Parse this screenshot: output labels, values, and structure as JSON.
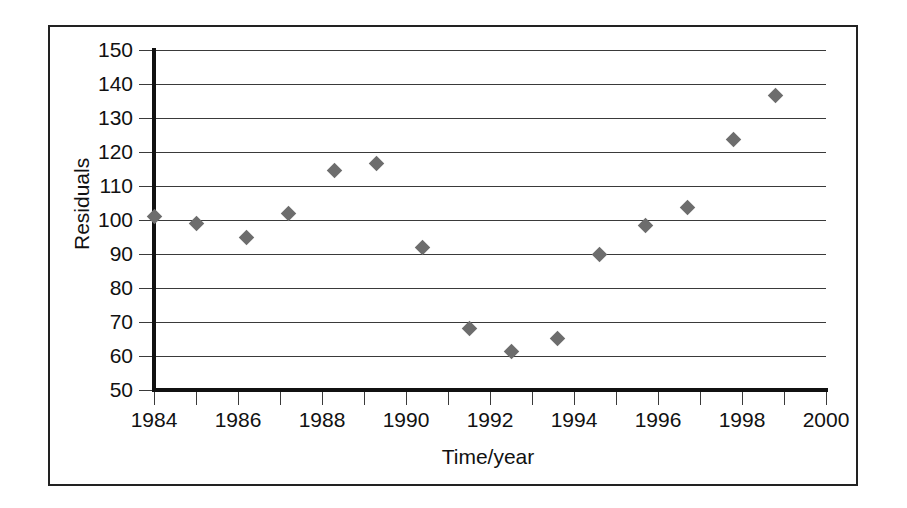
{
  "figure": {
    "background_color": "#ffffff",
    "frame_color": "#222222",
    "axis_color": "#111111",
    "gridline_color": "#3a3a3a",
    "marker_color": "#6d6d6d"
  },
  "chart_data": {
    "type": "scatter",
    "title": "",
    "xlabel": "Time/year",
    "ylabel": "Residuals",
    "xlim": [
      1984,
      2000
    ],
    "ylim": [
      50,
      150
    ],
    "grid": true,
    "legend": null,
    "x_ticks": [
      1984,
      1986,
      1988,
      1990,
      1992,
      1994,
      1996,
      1998,
      2000
    ],
    "x_tick_labels": [
      "1984",
      "1986",
      "1988",
      "1990",
      "1992",
      "1994",
      "1996",
      "1998",
      "2000"
    ],
    "x_minor_ticks": [
      1985,
      1987,
      1989,
      1991,
      1993,
      1995,
      1997,
      1999
    ],
    "y_ticks": [
      50,
      60,
      70,
      80,
      90,
      100,
      110,
      120,
      130,
      140,
      150
    ],
    "y_tick_labels": [
      "50",
      "60",
      "70",
      "80",
      "90",
      "100",
      "110",
      "120",
      "130",
      "140",
      "150"
    ],
    "marker_shape": "diamond",
    "points": [
      {
        "x": 1984.0,
        "y": 101.0
      },
      {
        "x": 1985.0,
        "y": 99.0
      },
      {
        "x": 1986.2,
        "y": 94.8
      },
      {
        "x": 1987.2,
        "y": 102.0
      },
      {
        "x": 1988.3,
        "y": 114.5
      },
      {
        "x": 1989.3,
        "y": 116.5
      },
      {
        "x": 1990.4,
        "y": 91.8
      },
      {
        "x": 1991.5,
        "y": 68.0
      },
      {
        "x": 1992.5,
        "y": 61.3
      },
      {
        "x": 1993.6,
        "y": 65.2
      },
      {
        "x": 1994.6,
        "y": 89.8
      },
      {
        "x": 1995.7,
        "y": 98.5
      },
      {
        "x": 1996.7,
        "y": 103.7
      },
      {
        "x": 1997.8,
        "y": 123.7
      },
      {
        "x": 1998.8,
        "y": 136.6
      }
    ]
  }
}
